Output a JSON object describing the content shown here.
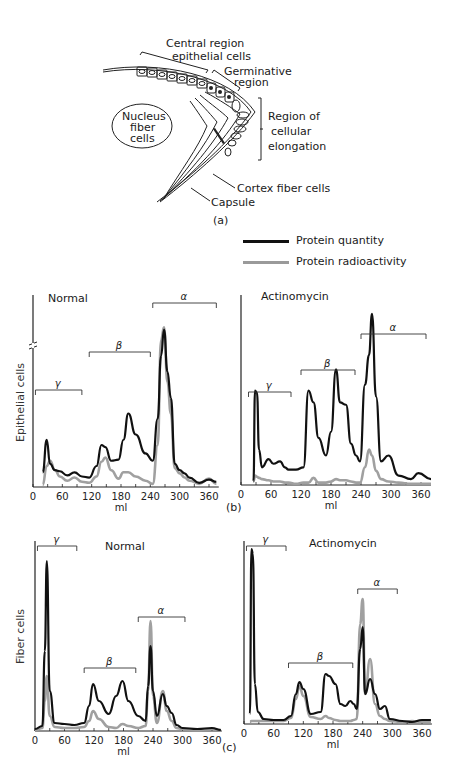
{
  "figure": {
    "panel_a": {
      "caption": "(a)",
      "labels": {
        "central_region_1": "Central region",
        "central_region_2": "epithelial cells",
        "germinative_1": "Germinative",
        "germinative_2": "region",
        "nucleus_1": "Nucleus",
        "nucleus_2": "fiber",
        "nucleus_3": "cells",
        "elongation_1": "Region of",
        "elongation_2": "cellular",
        "elongation_3": "elongation",
        "cortex": "Cortex fiber cells",
        "capsule": "Capsule"
      }
    },
    "legend": {
      "quantity": {
        "label": "Protein quantity",
        "color": "#111111"
      },
      "radioactivity": {
        "label": "Protein radioactivity",
        "color": "#9a9a9a"
      }
    },
    "panel_b": {
      "caption": "(b)",
      "row_label": "Epithelial cells"
    },
    "panel_c": {
      "caption": "(c)",
      "row_label": "Fiber cells"
    },
    "x_unit": "ml",
    "x_ticks": [
      "0",
      "60",
      "120",
      "180",
      "240",
      "300",
      "360"
    ],
    "fraction_labels": {
      "gamma": "γ",
      "beta": "β",
      "alpha": "α"
    }
  },
  "chart_data": [
    {
      "type": "line",
      "title": "Normal",
      "panel": "b",
      "ylabel": "Epithelial cells",
      "xlabel": "ml",
      "xlim": [
        0,
        380
      ],
      "y_axis_break": true,
      "x": [
        20,
        28,
        35,
        45,
        55,
        70,
        85,
        100,
        115,
        130,
        140,
        148,
        160,
        175,
        185,
        195,
        210,
        230,
        245,
        255,
        262,
        268,
        275,
        282,
        290,
        300,
        310,
        320,
        340,
        360,
        375
      ],
      "series": [
        {
          "name": "Protein quantity",
          "values": [
            14,
            45,
            22,
            16,
            15,
            11,
            14,
            10,
            9,
            20,
            40,
            38,
            25,
            26,
            45,
            70,
            50,
            32,
            25,
            65,
            125,
            150,
            110,
            85,
            22,
            16,
            13,
            9,
            4,
            7,
            5
          ]
        },
        {
          "name": "Protein radioactivity",
          "values": [
            2,
            20,
            25,
            16,
            10,
            6,
            9,
            5,
            4,
            10,
            24,
            28,
            16,
            8,
            14,
            14,
            10,
            6,
            3,
            40,
            140,
            152,
            100,
            70,
            18,
            13,
            9,
            6,
            3,
            8,
            3
          ]
        }
      ],
      "fractions": [
        {
          "label": "γ",
          "from": 5,
          "to": 100
        },
        {
          "label": "β",
          "from": 115,
          "to": 240
        },
        {
          "label": "α",
          "from": 245,
          "to": 375
        }
      ]
    },
    {
      "type": "line",
      "title": "Actinomycin",
      "panel": "b",
      "ylabel": "",
      "xlabel": "ml",
      "xlim": [
        0,
        380
      ],
      "x": [
        25,
        28,
        32,
        36,
        42,
        55,
        65,
        78,
        88,
        95,
        110,
        125,
        135,
        145,
        155,
        170,
        180,
        190,
        198,
        210,
        220,
        230,
        238,
        248,
        256,
        262,
        270,
        280,
        295,
        315,
        340,
        355,
        380
      ],
      "series": [
        {
          "name": "Protein quantity",
          "values": [
            3,
            80,
            78,
            30,
            15,
            22,
            18,
            20,
            15,
            13,
            13,
            15,
            80,
            70,
            40,
            25,
            45,
            98,
            70,
            68,
            35,
            25,
            20,
            85,
            110,
            145,
            75,
            20,
            25,
            8,
            5,
            10,
            5
          ]
        },
        {
          "name": "Protein radioactivity",
          "values": [
            3,
            8,
            7,
            6,
            5,
            4,
            3,
            3,
            2,
            2,
            1,
            2,
            2,
            6,
            2,
            2,
            3,
            5,
            4,
            4,
            3,
            2,
            2,
            15,
            30,
            25,
            12,
            5,
            3,
            2,
            1,
            1,
            1
          ]
        }
      ],
      "fractions": [
        {
          "label": "γ",
          "from": 15,
          "to": 100
        },
        {
          "label": "β",
          "from": 120,
          "to": 228
        },
        {
          "label": "α",
          "from": 240,
          "to": 370
        }
      ]
    },
    {
      "type": "line",
      "title": "Normal",
      "panel": "c",
      "ylabel": "Fiber cells",
      "xlabel": "ml",
      "xlim": [
        0,
        380
      ],
      "x": [
        0,
        15,
        20,
        24,
        30,
        40,
        60,
        80,
        100,
        110,
        118,
        130,
        150,
        165,
        178,
        190,
        210,
        225,
        230,
        235,
        240,
        248,
        260,
        268,
        278,
        288,
        300,
        330,
        360,
        378
      ],
      "series": [
        {
          "name": "Protein quantity",
          "values": [
            2,
            5,
            80,
            170,
            40,
            8,
            7,
            6,
            8,
            25,
            47,
            30,
            17,
            35,
            50,
            30,
            15,
            10,
            45,
            85,
            40,
            15,
            37,
            25,
            18,
            6,
            3,
            2,
            3,
            1
          ]
        },
        {
          "name": "Protein radioactivity",
          "values": [
            1,
            3,
            30,
            55,
            15,
            4,
            3,
            3,
            4,
            10,
            20,
            12,
            4,
            3,
            7,
            5,
            3,
            5,
            40,
            110,
            35,
            8,
            40,
            20,
            10,
            3,
            2,
            1,
            2,
            1
          ]
        }
      ],
      "fractions": [
        {
          "label": "γ",
          "from": 5,
          "to": 85
        },
        {
          "label": "β",
          "from": 100,
          "to": 205
        },
        {
          "label": "α",
          "from": 210,
          "to": 305
        }
      ]
    },
    {
      "type": "line",
      "title": "Actinomycin",
      "panel": "c",
      "ylabel": "",
      "xlabel": "ml",
      "xlim": [
        0,
        380
      ],
      "x": [
        12,
        15,
        18,
        22,
        28,
        40,
        60,
        80,
        95,
        105,
        112,
        120,
        135,
        155,
        165,
        172,
        185,
        195,
        205,
        215,
        222,
        228,
        235,
        240,
        245,
        255,
        265,
        275,
        285,
        295,
        320,
        340,
        360,
        378
      ],
      "series": [
        {
          "name": "Protein quantity",
          "values": [
            10,
            175,
            170,
            40,
            12,
            5,
            4,
            4,
            8,
            30,
            42,
            35,
            10,
            12,
            50,
            48,
            40,
            20,
            18,
            23,
            20,
            15,
            75,
            97,
            30,
            45,
            30,
            15,
            18,
            5,
            3,
            2,
            4,
            4
          ]
        },
        {
          "name": "Protein radioactivity",
          "values": [
            2,
            3,
            3,
            3,
            3,
            3,
            3,
            3,
            6,
            25,
            38,
            28,
            7,
            5,
            8,
            6,
            4,
            3,
            3,
            3,
            4,
            5,
            100,
            125,
            30,
            65,
            20,
            8,
            5,
            3,
            2,
            3,
            2,
            2
          ]
        }
      ],
      "fractions": [
        {
          "label": "γ",
          "from": 5,
          "to": 85
        },
        {
          "label": "β",
          "from": 90,
          "to": 220
        },
        {
          "label": "α",
          "from": 230,
          "to": 310
        }
      ]
    }
  ]
}
